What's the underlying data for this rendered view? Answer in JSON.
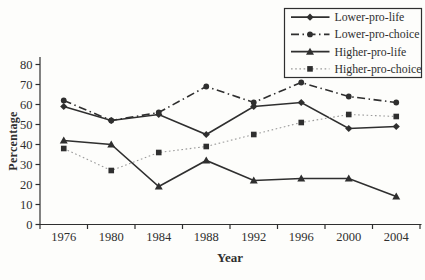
{
  "colors": {
    "background": "#fdfdfb",
    "ink": "#2f2f2f",
    "dotted_line": "#9a9a9a"
  },
  "chart_data": {
    "type": "line",
    "title": "",
    "xlabel": "Year",
    "ylabel": "Percentage",
    "categories": [
      "1976",
      "1980",
      "1984",
      "1988",
      "1992",
      "1996",
      "2000",
      "2004"
    ],
    "ylim": [
      0,
      80
    ],
    "yticks": [
      0,
      10,
      20,
      30,
      40,
      50,
      60,
      70,
      80
    ],
    "grid": false,
    "legend_position": "top-right",
    "series": [
      {
        "name": "Lower-pro-life",
        "values": [
          59,
          52,
          55,
          45,
          59,
          61,
          48,
          49
        ],
        "line_style": "solid",
        "marker": "diamond",
        "color": "#2f2f2f"
      },
      {
        "name": "Lower-pro-choice",
        "values": [
          62,
          52,
          56,
          69,
          61,
          71,
          64,
          61
        ],
        "line_style": "dash-dot",
        "marker": "circle",
        "color": "#2f2f2f"
      },
      {
        "name": "Higher-pro-life",
        "values": [
          42,
          40,
          19,
          32,
          22,
          23,
          23,
          14
        ],
        "line_style": "solid",
        "marker": "triangle",
        "color": "#2f2f2f"
      },
      {
        "name": "Higher-pro-choice",
        "values": [
          38,
          27,
          36,
          39,
          45,
          51,
          55,
          54
        ],
        "line_style": "dotted",
        "marker": "square",
        "color": "#9a9a9a",
        "marker_color": "#2f2f2f"
      }
    ]
  }
}
